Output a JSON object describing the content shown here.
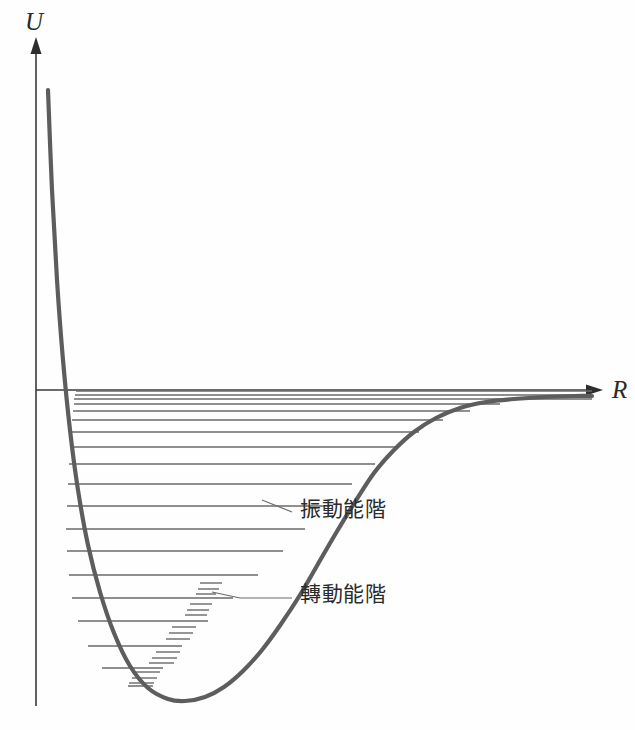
{
  "figure": {
    "title_visible": false,
    "background_color": "#fefefe",
    "axes": {
      "y_label": "U",
      "x_label": "R",
      "y_axis_x": 36,
      "y_axis_top": 48,
      "y_axis_bottom": 706,
      "x_axis_y": 390,
      "x_axis_left": 36,
      "x_axis_right": 592
    },
    "colors": {
      "curve": "#5d5d5d",
      "axis": "#3a3a3a",
      "level": "#6a6a6a",
      "rotational": "#7b7b7b",
      "text": "#2b2b2b"
    }
  },
  "annotations": [
    {
      "id": "vibrational",
      "label": "振動能階",
      "x": 300,
      "y": 516,
      "leader": "M 262 500 L 292 512"
    },
    {
      "id": "rotational",
      "label": "轉動能階",
      "x": 300,
      "y": 601,
      "leader": "M 212 592 L 240 598 L 292 598"
    }
  ],
  "chart_data": {
    "type": "line",
    "title": "",
    "subtitle": "",
    "xlabel": "R",
    "ylabel": "U",
    "grid": false,
    "legend_position": "none",
    "xlim": [
      0,
      635
    ],
    "ylim": [
      730,
      0
    ],
    "dissociation_limit_y": 390,
    "equilibrium_x": 185,
    "well_minimum_y": 700,
    "curve_points": [
      [
        48,
        90
      ],
      [
        52,
        190
      ],
      [
        57,
        280
      ],
      [
        63,
        360
      ],
      [
        70,
        430
      ],
      [
        78,
        490
      ],
      [
        88,
        545
      ],
      [
        100,
        592
      ],
      [
        114,
        633
      ],
      [
        130,
        666
      ],
      [
        148,
        688
      ],
      [
        168,
        699
      ],
      [
        185,
        701
      ],
      [
        205,
        697
      ],
      [
        224,
        687
      ],
      [
        243,
        671
      ],
      [
        262,
        650
      ],
      [
        281,
        624
      ],
      [
        300,
        595
      ],
      [
        318,
        564
      ],
      [
        336,
        533
      ],
      [
        355,
        502
      ],
      [
        374,
        473
      ],
      [
        394,
        450
      ],
      [
        414,
        432
      ],
      [
        436,
        418
      ],
      [
        460,
        408
      ],
      [
        486,
        402
      ],
      [
        514,
        399
      ],
      [
        545,
        397
      ],
      [
        575,
        396
      ],
      [
        592,
        396
      ]
    ],
    "vibrational_levels": [
      {
        "v": 18,
        "y": 391,
        "x0": 76,
        "x1": 592
      },
      {
        "v": 17,
        "y": 395,
        "x0": 75,
        "x1": 592
      },
      {
        "v": 16,
        "y": 399,
        "x0": 74,
        "x1": 592
      },
      {
        "v": 15,
        "y": 404,
        "x0": 74,
        "x1": 500
      },
      {
        "v": 14,
        "y": 411,
        "x0": 73,
        "x1": 470
      },
      {
        "v": 13,
        "y": 420,
        "x0": 72,
        "x1": 443
      },
      {
        "v": 12,
        "y": 432,
        "x0": 71,
        "x1": 419
      },
      {
        "v": 11,
        "y": 447,
        "x0": 70,
        "x1": 397
      },
      {
        "v": 10,
        "y": 464,
        "x0": 69,
        "x1": 375
      },
      {
        "v": 9,
        "y": 484,
        "x0": 68,
        "x1": 352
      },
      {
        "v": 8,
        "y": 506,
        "x0": 67,
        "x1": 330
      },
      {
        "v": 7,
        "y": 529,
        "x0": 66,
        "x1": 305
      },
      {
        "v": 6,
        "y": 551,
        "x0": 67,
        "x1": 283
      },
      {
        "v": 5,
        "y": 575,
        "x0": 69,
        "x1": 258
      },
      {
        "v": 4,
        "y": 598,
        "x0": 72,
        "x1": 233
      },
      {
        "v": 3,
        "y": 621,
        "x0": 78,
        "x1": 208
      },
      {
        "v": 2,
        "y": 646,
        "x0": 88,
        "x1": 182
      },
      {
        "v": 1,
        "y": 668,
        "x0": 102,
        "x1": 163
      },
      {
        "v": 0,
        "y": 686,
        "x0": 128,
        "x1": 153
      }
    ],
    "rotational_sublevels": [
      {
        "y": 583,
        "x0": 200,
        "x1": 222
      },
      {
        "y": 589,
        "x0": 198,
        "x1": 219
      },
      {
        "y": 594,
        "x0": 196,
        "x1": 216
      },
      {
        "y": 604,
        "x0": 190,
        "x1": 212
      },
      {
        "y": 610,
        "x0": 187,
        "x1": 209
      },
      {
        "y": 615,
        "x0": 185,
        "x1": 207
      },
      {
        "y": 627,
        "x0": 172,
        "x1": 196
      },
      {
        "y": 633,
        "x0": 169,
        "x1": 193
      },
      {
        "y": 639,
        "x0": 166,
        "x1": 190
      },
      {
        "y": 652,
        "x0": 156,
        "x1": 180
      },
      {
        "y": 658,
        "x0": 152,
        "x1": 177
      },
      {
        "y": 663,
        "x0": 149,
        "x1": 174
      },
      {
        "y": 672,
        "x0": 136,
        "x1": 160
      },
      {
        "y": 678,
        "x0": 132,
        "x1": 157
      },
      {
        "y": 683,
        "x0": 129,
        "x1": 154
      }
    ]
  }
}
